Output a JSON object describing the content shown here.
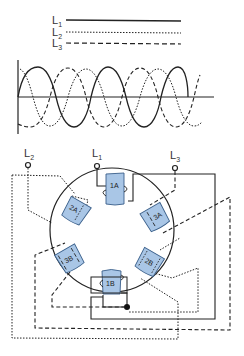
{
  "legend": {
    "items": [
      {
        "label": "L",
        "sub": "1",
        "style": "solid"
      },
      {
        "label": "L",
        "sub": "2",
        "style": "dotted"
      },
      {
        "label": "L",
        "sub": "3",
        "style": "dashed"
      }
    ]
  },
  "waveform": {
    "description": "Three-phase sine waves L1 (solid), L2 (dotted), L3 (dashed), 120 degrees apart",
    "phases": [
      "L1",
      "L2",
      "L3"
    ]
  },
  "motor": {
    "terminals": [
      {
        "label": "L",
        "sub": "2"
      },
      {
        "label": "L",
        "sub": "1"
      },
      {
        "label": "L",
        "sub": "3"
      }
    ],
    "poles": [
      {
        "label": "1A"
      },
      {
        "label": "2A"
      },
      {
        "label": "3A"
      },
      {
        "label": "3B"
      },
      {
        "label": "2B"
      },
      {
        "label": "1B"
      }
    ]
  },
  "colors": {
    "pole_fill": "#a9c6e6",
    "pole_stroke": "#3a5f8a",
    "line": "#222222"
  }
}
